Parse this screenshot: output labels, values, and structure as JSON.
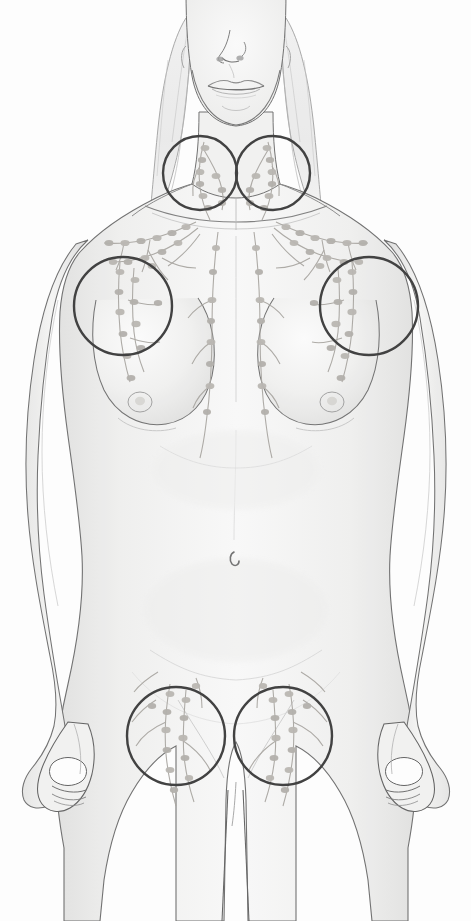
{
  "image": {
    "title": "Female anterior torso lymphatic system diagram",
    "type": "medical-anatomical-illustration",
    "style": "pencil-sketch grayscale line drawing with soft shading",
    "width": 471,
    "height": 921,
    "background_color": "#ffffff",
    "partial_caption_top": "y   p"
  },
  "palette": {
    "background": "#ffffff",
    "skin_fill": "#f4f4f3",
    "skin_shade": "#e9e9e8",
    "skin_shade_deep": "#dededd",
    "outline": "#6d6d6d",
    "outline_dark": "#4a4a4a",
    "hair": "#ededed",
    "hair_stroke": "#9a9a9a",
    "lymph_node": "#b9b6b1",
    "lymph_node_dark": "#a6a39e",
    "lymph_vessel": "#a8a5a0",
    "highlight_circle": "#3a3a3a"
  },
  "subject": {
    "name": "female-figure",
    "view": "anterior",
    "visible_parts": [
      "lower-face",
      "nose",
      "lips",
      "chin",
      "jawline",
      "hair",
      "neck",
      "clavicles",
      "shoulders",
      "arms",
      "hands",
      "breasts",
      "torso",
      "navel",
      "hips",
      "thighs"
    ]
  },
  "highlight_circles": [
    {
      "id": "cervical-left",
      "label": "Left cervical / supraclavicular nodes",
      "cx": 200,
      "cy": 173,
      "r": 37,
      "stroke": "#3a3a3a",
      "stroke_width": 2.4
    },
    {
      "id": "cervical-right",
      "label": "Right cervical / supraclavicular nodes",
      "cx": 273,
      "cy": 173,
      "r": 37,
      "stroke": "#3a3a3a",
      "stroke_width": 2.4
    },
    {
      "id": "axillary-left",
      "label": "Left axillary nodes",
      "cx": 123,
      "cy": 306,
      "r": 49,
      "stroke": "#3a3a3a",
      "stroke_width": 2.4
    },
    {
      "id": "axillary-right",
      "label": "Right axillary nodes",
      "cx": 369,
      "cy": 306,
      "r": 49,
      "stroke": "#3a3a3a",
      "stroke_width": 2.4
    },
    {
      "id": "inguinal-left",
      "label": "Left inguinal nodes",
      "cx": 176,
      "cy": 736,
      "r": 49,
      "stroke": "#3a3a3a",
      "stroke_width": 2.4
    },
    {
      "id": "inguinal-right",
      "label": "Right inguinal nodes",
      "cx": 283,
      "cy": 736,
      "r": 49,
      "stroke": "#3a3a3a",
      "stroke_width": 2.4
    }
  ],
  "lymph_groups": [
    {
      "id": "cervical-left-chain",
      "region": "neck",
      "node_count": 9
    },
    {
      "id": "cervical-right-chain",
      "region": "neck",
      "node_count": 9
    },
    {
      "id": "supraclavicular-left",
      "region": "clavicle",
      "node_count": 11
    },
    {
      "id": "supraclavicular-right",
      "region": "clavicle",
      "node_count": 11
    },
    {
      "id": "axillary-left-chain",
      "region": "armpit",
      "node_count": 12
    },
    {
      "id": "axillary-right-chain",
      "region": "armpit",
      "node_count": 12
    },
    {
      "id": "parasternal-left",
      "region": "sternum",
      "node_count": 8
    },
    {
      "id": "parasternal-right",
      "region": "sternum",
      "node_count": 8
    },
    {
      "id": "inguinal-left-chain",
      "region": "groin",
      "node_count": 13
    },
    {
      "id": "inguinal-right-chain",
      "region": "groin",
      "node_count": 13
    }
  ]
}
